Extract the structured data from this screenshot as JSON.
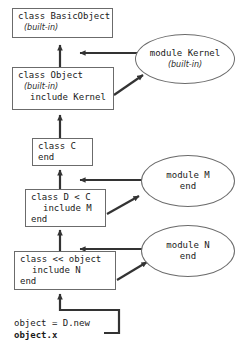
{
  "diagram": {
    "colors": {
      "stroke": "#6b6b6b",
      "arrow": "#333333",
      "text": "#1a1a1a",
      "background": "#ffffff"
    },
    "nodes": [
      {
        "id": "basicobject",
        "shape": "box",
        "lines": [
          "class BasicObject",
          "(built-in)"
        ]
      },
      {
        "id": "object",
        "shape": "box",
        "lines": [
          "class Object",
          "(built-in)",
          "include Kernel"
        ]
      },
      {
        "id": "kernel",
        "shape": "ellipse",
        "lines": [
          "module Kernel",
          "(built-in)"
        ]
      },
      {
        "id": "class-c",
        "shape": "box",
        "lines": [
          "class C",
          "end"
        ]
      },
      {
        "id": "module-m",
        "shape": "ellipse",
        "lines": [
          "module M",
          "end"
        ]
      },
      {
        "id": "class-d",
        "shape": "box",
        "lines": [
          "class D < C",
          "include M",
          "end"
        ]
      },
      {
        "id": "module-n",
        "shape": "ellipse",
        "lines": [
          "module N",
          "end"
        ]
      },
      {
        "id": "singleton",
        "shape": "box",
        "lines": [
          "class << object",
          "include N",
          "end"
        ]
      },
      {
        "id": "usage",
        "shape": "plain",
        "lines": [
          "object = D.new",
          "object.x"
        ]
      }
    ],
    "edges": [
      {
        "from": "object",
        "to": "basicobject",
        "style": "solid-arrow-up"
      },
      {
        "from": "kernel",
        "to": "object-chain",
        "style": "solid-arrow-left"
      },
      {
        "from": "object",
        "to": "kernel",
        "style": "solid-arrow-diagonal"
      },
      {
        "from": "class-c",
        "to": "object",
        "style": "solid-arrow-up"
      },
      {
        "from": "class-d",
        "to": "class-c",
        "style": "solid-arrow-up"
      },
      {
        "from": "module-m",
        "to": "class-d-chain",
        "style": "solid-arrow-left"
      },
      {
        "from": "class-d",
        "to": "module-m",
        "style": "solid-arrow-diagonal"
      },
      {
        "from": "singleton",
        "to": "class-d",
        "style": "solid-arrow-up"
      },
      {
        "from": "module-n",
        "to": "singleton-chain",
        "style": "solid-arrow-left"
      },
      {
        "from": "singleton",
        "to": "module-n",
        "style": "solid-arrow-diagonal"
      },
      {
        "from": "usage",
        "to": "singleton",
        "style": "elbow-arrow-up"
      }
    ]
  }
}
